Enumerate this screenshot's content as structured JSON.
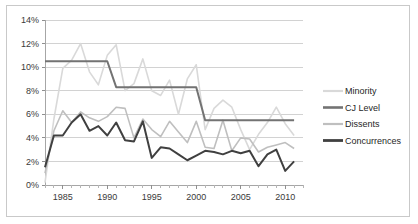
{
  "chart_data": {
    "type": "line",
    "title": "",
    "xlabel": "",
    "ylabel": "",
    "xlim": [
      1983,
      2012
    ],
    "ylim": [
      0,
      14
    ],
    "grid": true,
    "legend_position": "right",
    "y_ticks": [
      "0%",
      "2%",
      "4%",
      "6%",
      "8%",
      "10%",
      "12%",
      "14%"
    ],
    "y_tick_values": [
      0,
      2,
      4,
      6,
      8,
      10,
      12,
      14
    ],
    "x_ticks": [
      "1985",
      "1990",
      "1995",
      "2000",
      "2005",
      "2010"
    ],
    "x_tick_values": [
      1985,
      1990,
      1995,
      2000,
      2005,
      2010
    ],
    "x": [
      1983,
      1984,
      1985,
      1986,
      1987,
      1988,
      1989,
      1990,
      1991,
      1992,
      1993,
      1994,
      1995,
      1996,
      1997,
      1998,
      1999,
      2000,
      2001,
      2002,
      2003,
      2004,
      2005,
      2006,
      2007,
      2008,
      2009,
      2010,
      2011
    ],
    "series": [
      {
        "name": "Minority",
        "color": "#d9d9d9",
        "width": 1.6,
        "values": [
          0.2,
          5.6,
          9.9,
          10.6,
          12.0,
          9.6,
          8.5,
          11.0,
          11.9,
          8.0,
          8.6,
          10.7,
          8.0,
          7.6,
          8.9,
          6.0,
          9.0,
          10.2,
          4.7,
          6.5,
          7.2,
          6.6,
          4.7,
          3.0,
          4.3,
          5.3,
          6.6,
          5.2,
          4.2
        ]
      },
      {
        "name": "CJ Level",
        "color": "#737373",
        "width": 2.0,
        "values": [
          10.5,
          10.5,
          10.5,
          10.5,
          10.5,
          10.5,
          10.5,
          10.5,
          8.3,
          8.3,
          8.3,
          8.3,
          8.3,
          8.3,
          8.3,
          8.3,
          8.3,
          8.3,
          5.5,
          5.5,
          5.5,
          5.5,
          5.5,
          5.5,
          5.5,
          5.5,
          5.5,
          5.5,
          5.5
        ]
      },
      {
        "name": "Dissents",
        "color": "#bfbfbf",
        "width": 1.6,
        "values": [
          1.0,
          4.6,
          6.3,
          5.3,
          6.2,
          5.7,
          5.4,
          5.8,
          6.6,
          6.5,
          4.0,
          5.6,
          4.7,
          4.1,
          5.4,
          4.5,
          3.6,
          5.4,
          3.2,
          3.1,
          5.5,
          2.9,
          4.0,
          3.9,
          2.8,
          3.2,
          3.4,
          3.6,
          3.1
        ]
      },
      {
        "name": "Concurrences",
        "color": "#404040",
        "width": 2.0,
        "values": [
          1.5,
          4.2,
          4.2,
          5.3,
          6.0,
          4.6,
          5.0,
          4.2,
          5.3,
          3.8,
          3.7,
          5.4,
          2.3,
          3.2,
          3.1,
          2.6,
          2.1,
          2.5,
          2.9,
          2.8,
          2.6,
          2.9,
          2.7,
          2.9,
          1.6,
          2.6,
          3.0,
          1.2,
          2.0
        ]
      }
    ],
    "legend": [
      {
        "label": "Minority",
        "color": "#d9d9d9",
        "width": 2.2
      },
      {
        "label": "CJ Level",
        "color": "#737373",
        "width": 2.6
      },
      {
        "label": "Dissents",
        "color": "#bfbfbf",
        "width": 2.2
      },
      {
        "label": "Concurrences",
        "color": "#404040",
        "width": 2.8
      }
    ]
  }
}
